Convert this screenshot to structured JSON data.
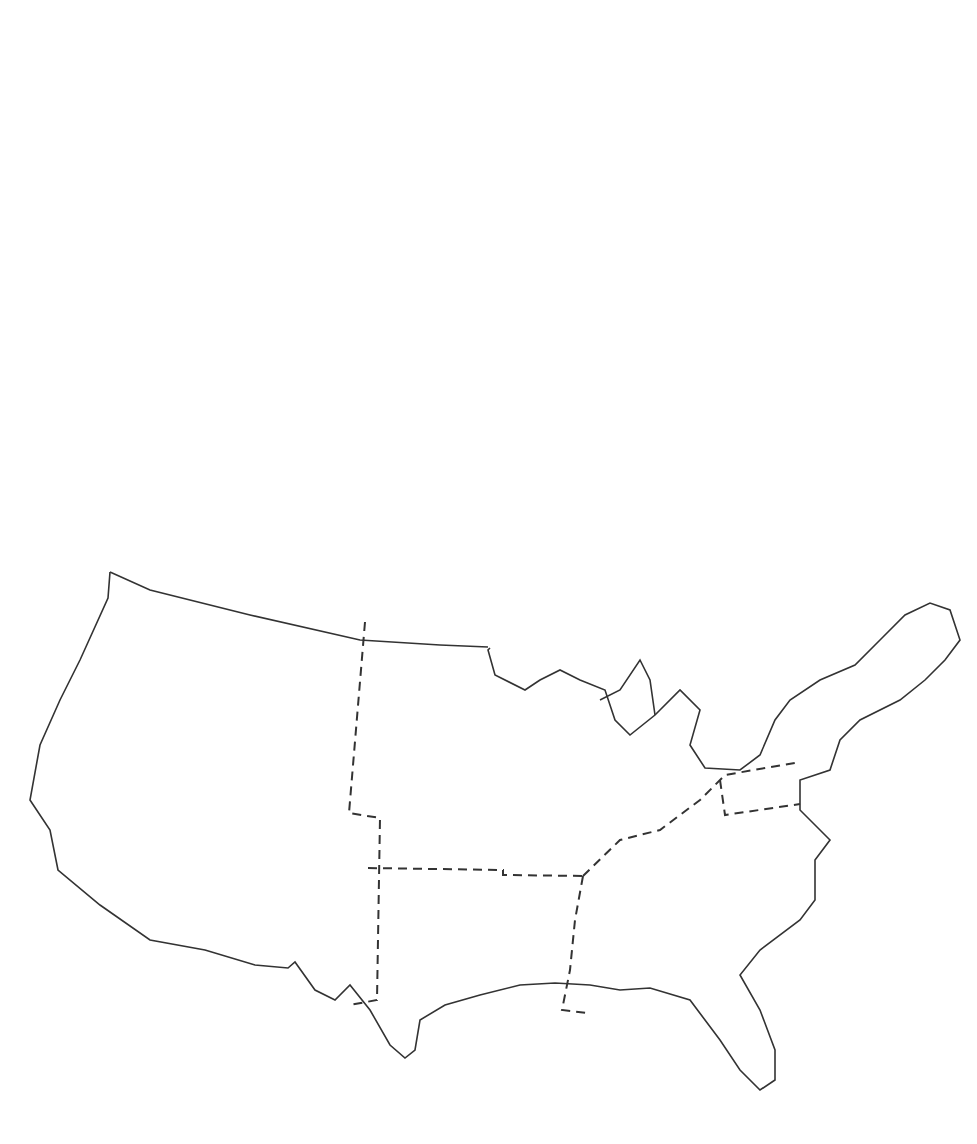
{
  "caption": "Figure 10.14    Mississippi 1830, 1840 to 1880",
  "legend": {
    "items": [
      {
        "label": "Percent Population",
        "pattern": "solid"
      },
      {
        "label": "Income/Capita",
        "pattern": "hatch-back"
      },
      {
        "label": "Industrial Labor",
        "label2": "Force Index",
        "pattern": "light"
      }
    ]
  },
  "colors": {
    "dark": "#1e1e1e",
    "light": "#dcdcdc",
    "line": "#3a3a3a"
  },
  "chart_data": [
    {
      "id": "population",
      "type": "bar",
      "title": "Population (millions)",
      "categories": [
        "1830",
        "1880"
      ],
      "values": [
        13,
        50
      ],
      "yticks": [
        0,
        10,
        20,
        30,
        40,
        50,
        60
      ],
      "ylim": [
        0,
        60
      ]
    },
    {
      "id": "gnp",
      "type": "bar",
      "title": "GNP (billions, 1860$)",
      "categories": [
        "1830",
        "1880"
      ],
      "values": [
        1,
        12.9
      ],
      "yticks": [
        0,
        3,
        6,
        9,
        12,
        15
      ],
      "ylim": [
        0,
        15
      ]
    },
    {
      "id": "gnp_capita",
      "type": "bar",
      "title": "GNP/Capita (1860$)",
      "categories": [
        "1830",
        "1880"
      ],
      "values": [
        80,
        258
      ],
      "yticks": [
        0,
        50,
        100,
        150,
        200,
        250,
        300
      ],
      "ylim": [
        0,
        300
      ]
    },
    {
      "id": "settled_area",
      "type": "bar",
      "title": "Settled Area",
      "title2": "(millions, sq. miles)",
      "categories": [
        "1830",
        "1880"
      ],
      "values": [
        0.62,
        1.49
      ],
      "yticks": [
        "0.0",
        "0.3",
        "0.6",
        "0.9",
        "1.2",
        "1.5"
      ],
      "ylim": [
        0,
        1.5
      ]
    },
    {
      "id": "net_immigrants",
      "type": "bar",
      "title": "Net Immigrants",
      "title2": "(millions)",
      "categories": [
        "1830-1880",
        "1880-1930"
      ],
      "values": [
        9.7,
        18.6
      ],
      "yticks": [
        0,
        5,
        10,
        15,
        20
      ],
      "ylim": [
        0,
        20
      ]
    },
    {
      "id": "exports_imports",
      "type": "bar",
      "title": "Exports/Imports",
      "title2": "(billions, 1860$)",
      "categories": [
        "1830",
        "1880"
      ],
      "series": [
        {
          "name": "Exp.",
          "values": [
            0.82,
            1.05
          ]
        },
        {
          "name": "Imp.",
          "values": [
            0.79,
            0.93
          ]
        }
      ],
      "yticks": [
        "0.0",
        "0.2",
        "0.4",
        "0.6",
        "0.8",
        "1.0",
        "1.2"
      ],
      "ylim": [
        0,
        1.2
      ]
    },
    {
      "id": "exports_capita",
      "type": "bar",
      "title": "Exports/Capita",
      "title2": "(1860$)",
      "categories": [
        "1830",
        "1880"
      ],
      "values": [
        64,
        21
      ],
      "yticks": [
        0,
        20,
        40,
        60,
        80
      ],
      "ylim": [
        0,
        80
      ]
    },
    {
      "id": "regions",
      "type": "bar",
      "regions": [
        {
          "name": "West",
          "percent_population": {
            "years": [
              "1880"
            ],
            "values": [
              2
            ]
          },
          "income_capita": {
            "years": [
              "1880"
            ],
            "values": [
              190
            ]
          },
          "industrial_labor": {
            "years": [
              "1880"
            ],
            "values": [
              168
            ]
          }
        },
        {
          "name": "Midwest",
          "percent_population": {
            "years": [
              "1830",
              "1880"
            ],
            "values": [
              19,
              34
            ]
          },
          "income_capita": {
            "years": [
              "1840",
              "1880"
            ],
            "values": [
              68,
              98
            ]
          },
          "industrial_labor": {
            "years": [
              "1840",
              "1880"
            ],
            "values": [
              85,
              85
            ]
          }
        },
        {
          "name": "Northeast",
          "percent_population": {
            "years": [
              "1830",
              "1880"
            ],
            "values": [
              43,
              31
            ]
          },
          "income_capita": {
            "years": [
              "1840",
              "1880"
            ],
            "values": [
              135,
              140
            ]
          },
          "industrial_labor": {
            "years": [
              "1840",
              "1880"
            ],
            "values": [
              163,
              188
            ]
          }
        },
        {
          "name": "South Central",
          "percent_population": {
            "years": [
              "1830",
              "1880"
            ],
            "values": [
              2,
              7
            ]
          },
          "income_capita": {
            "years": [
              "1840",
              "1880"
            ],
            "values": [
              144,
              60
            ]
          },
          "industrial_labor": {
            "years": [
              "1840",
              "1880"
            ],
            "values": [
              67,
              28
            ]
          }
        },
        {
          "name": "South Atlantic",
          "percent_population": {
            "years": [
              "1830",
              "1880"
            ],
            "values": [
              35,
              24
            ]
          },
          "income_capita": {
            "years": [
              "1840",
              "1880"
            ],
            "values": [
              72,
              48
            ]
          },
          "industrial_labor": {
            "years": [
              "1840",
              "1880"
            ],
            "values": [
              45,
              30
            ]
          }
        }
      ]
    }
  ]
}
